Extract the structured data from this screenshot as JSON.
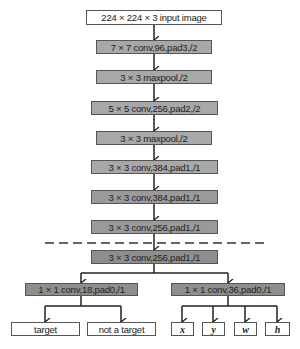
{
  "diagram": {
    "input": "224 × 224 × 3 input image",
    "backbone": [
      "7 × 7 conv,96,pad3,/2",
      "3 × 3 maxpool,/2",
      "5 × 5 conv,256,pad2,/2",
      "3 × 3 maxpool,/2",
      "3 × 3 conv,384,pad1,/1",
      "3 × 3 conv,384,pad1,/1",
      "3 × 3 conv,256,pad1,/1"
    ],
    "shared": "3 × 3 conv,256,pad1,/1",
    "cls_branch": {
      "conv": "1 × 1 conv,18,pad0,/1",
      "outputs": [
        "target",
        "not a target"
      ]
    },
    "reg_branch": {
      "conv": "1 × 1 conv,36,pad0,/1",
      "outputs": [
        "x",
        "y",
        "w",
        "h"
      ]
    },
    "colors": {
      "box_border": "#555555",
      "gray_light": "#a8a8a8",
      "gray_mid": "#9a9a9a",
      "gray_dark": "#8e8e8e",
      "arrow": "#222222"
    }
  }
}
